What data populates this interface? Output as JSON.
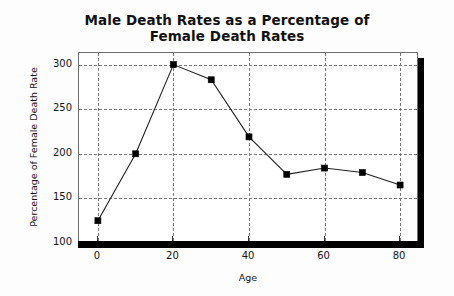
{
  "chart_data": {
    "type": "line",
    "title": "Male Death Rates as a Percentage of Female Death Rates",
    "title_lines": [
      "Male Death Rates as a Percentage of",
      "Female Death Rates"
    ],
    "xlabel": "Age",
    "ylabel": "Percentage of Female Death Rate",
    "x": [
      0,
      10,
      20,
      30,
      40,
      50,
      60,
      70,
      80
    ],
    "values": [
      125,
      200,
      300,
      283,
      219,
      177,
      184,
      179,
      165
    ],
    "xlim": [
      -5,
      85
    ],
    "ylim": [
      100,
      313
    ],
    "xticks": [
      0,
      20,
      40,
      60,
      80
    ],
    "xtick_labels": [
      "0",
      "20",
      "40",
      "60",
      "80"
    ],
    "yticks": [
      100,
      150,
      200,
      250,
      300
    ],
    "ytick_labels": [
      "100",
      "150",
      "200",
      "250",
      "300"
    ],
    "grid": true,
    "grid_style": "dashed",
    "legend": "none",
    "marker": "square",
    "line_color": "#202020",
    "marker_color": "#000000",
    "grid_color": "#777777",
    "background_color": "#ffffff"
  }
}
